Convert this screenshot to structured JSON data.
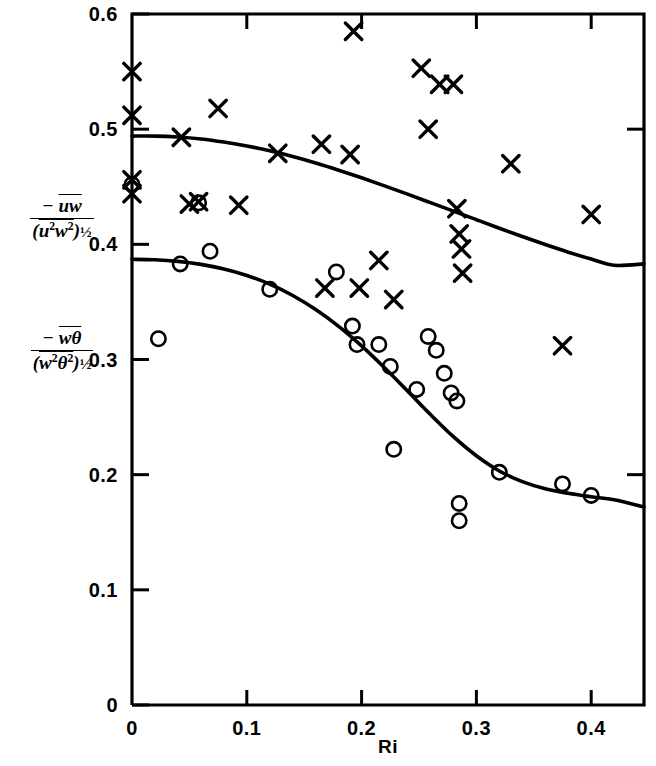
{
  "chart_data": {
    "type": "scatter",
    "title": "",
    "xlabel": "Ri",
    "ylabel_upper": "-uw / (u²w²)^½",
    "ylabel_lower": "-wθ / (w²θ²)^½",
    "xlim": [
      0,
      0.446
    ],
    "ylim": [
      0,
      0.6
    ],
    "xticks": [
      0,
      0.1,
      0.2,
      0.3,
      0.4
    ],
    "xtick_labels": [
      "0",
      "0.1",
      "0.2",
      "0.3",
      "0.4"
    ],
    "yticks": [
      0,
      0.1,
      0.2,
      0.3,
      0.4,
      0.5,
      0.6
    ],
    "ytick_labels": [
      "0",
      "0.1",
      "0.2",
      "0.3",
      "0.4",
      "0.5",
      "0.6"
    ],
    "grid": false,
    "legend": "none",
    "marker_colors": {
      "cross": "#000000",
      "circle": "#000000",
      "curve": "#000000"
    },
    "series": [
      {
        "name": "momentum flux correlation",
        "marker": "cross",
        "points": [
          [
            0.0,
            0.55
          ],
          [
            0.0,
            0.512
          ],
          [
            0.0,
            0.456
          ],
          [
            0.0,
            0.444
          ],
          [
            0.043,
            0.493
          ],
          [
            0.05,
            0.435
          ],
          [
            0.058,
            0.437
          ],
          [
            0.075,
            0.518
          ],
          [
            0.093,
            0.434
          ],
          [
            0.127,
            0.479
          ],
          [
            0.165,
            0.487
          ],
          [
            0.168,
            0.362
          ],
          [
            0.19,
            0.478
          ],
          [
            0.193,
            0.585
          ],
          [
            0.198,
            0.362
          ],
          [
            0.215,
            0.386
          ],
          [
            0.228,
            0.352
          ],
          [
            0.252,
            0.553
          ],
          [
            0.258,
            0.5
          ],
          [
            0.268,
            0.539
          ],
          [
            0.28,
            0.539
          ],
          [
            0.283,
            0.431
          ],
          [
            0.285,
            0.409
          ],
          [
            0.287,
            0.396
          ],
          [
            0.288,
            0.375
          ],
          [
            0.33,
            0.47
          ],
          [
            0.375,
            0.312
          ],
          [
            0.4,
            0.426
          ]
        ]
      },
      {
        "name": "heat flux correlation",
        "marker": "circle",
        "points": [
          [
            0.0,
            0.452
          ],
          [
            0.023,
            0.318
          ],
          [
            0.042,
            0.383
          ],
          [
            0.058,
            0.436
          ],
          [
            0.068,
            0.394
          ],
          [
            0.12,
            0.361
          ],
          [
            0.178,
            0.376
          ],
          [
            0.192,
            0.329
          ],
          [
            0.196,
            0.313
          ],
          [
            0.215,
            0.313
          ],
          [
            0.225,
            0.294
          ],
          [
            0.228,
            0.222
          ],
          [
            0.248,
            0.274
          ],
          [
            0.258,
            0.32
          ],
          [
            0.265,
            0.308
          ],
          [
            0.272,
            0.288
          ],
          [
            0.278,
            0.271
          ],
          [
            0.283,
            0.264
          ],
          [
            0.285,
            0.175
          ],
          [
            0.285,
            0.16
          ],
          [
            0.32,
            0.202
          ],
          [
            0.375,
            0.192
          ],
          [
            0.4,
            0.182
          ]
        ]
      }
    ],
    "curves": [
      {
        "name": "momentum flux fit",
        "points": [
          [
            0.0,
            0.494
          ],
          [
            0.02,
            0.494
          ],
          [
            0.04,
            0.4932
          ],
          [
            0.06,
            0.4915
          ],
          [
            0.08,
            0.4888
          ],
          [
            0.1,
            0.4854
          ],
          [
            0.12,
            0.4812
          ],
          [
            0.14,
            0.4762
          ],
          [
            0.16,
            0.4706
          ],
          [
            0.18,
            0.4644
          ],
          [
            0.2,
            0.4578
          ],
          [
            0.22,
            0.4508
          ],
          [
            0.24,
            0.4436
          ],
          [
            0.26,
            0.4362
          ],
          [
            0.28,
            0.4288
          ],
          [
            0.3,
            0.4214
          ],
          [
            0.32,
            0.414
          ],
          [
            0.34,
            0.4068
          ],
          [
            0.36,
            0.3998
          ],
          [
            0.38,
            0.3932
          ],
          [
            0.4,
            0.3872
          ],
          [
            0.42,
            0.3818
          ],
          [
            0.446,
            0.383
          ]
        ]
      },
      {
        "name": "heat flux fit",
        "points": [
          [
            0.0,
            0.387
          ],
          [
            0.02,
            0.3866
          ],
          [
            0.04,
            0.3852
          ],
          [
            0.06,
            0.3826
          ],
          [
            0.08,
            0.3786
          ],
          [
            0.1,
            0.373
          ],
          [
            0.12,
            0.3654
          ],
          [
            0.14,
            0.3556
          ],
          [
            0.16,
            0.3434
          ],
          [
            0.18,
            0.3288
          ],
          [
            0.2,
            0.3118
          ],
          [
            0.22,
            0.2928
          ],
          [
            0.24,
            0.2726
          ],
          [
            0.26,
            0.2522
          ],
          [
            0.28,
            0.233
          ],
          [
            0.3,
            0.2164
          ],
          [
            0.32,
            0.2032
          ],
          [
            0.34,
            0.194
          ],
          [
            0.36,
            0.1878
          ],
          [
            0.38,
            0.1838
          ],
          [
            0.4,
            0.1808
          ],
          [
            0.42,
            0.1782
          ],
          [
            0.446,
            0.172
          ]
        ]
      }
    ]
  },
  "axes": {
    "x_title": "Ri",
    "y_upper_numerator": "uw",
    "y_upper_denominator": "(u2w2)",
    "y_lower_numerator": "wθ",
    "y_lower_denominator": "(w2θ2)",
    "minus_sign": "−",
    "exponent_half": "½",
    "square": "2"
  }
}
